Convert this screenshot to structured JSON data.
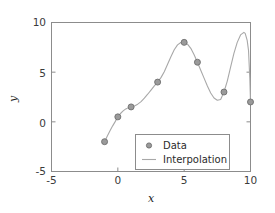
{
  "chart_data": {
    "type": "line",
    "title": "",
    "xlabel": "x",
    "ylabel": "y",
    "xlim": [
      -5,
      10
    ],
    "ylim": [
      -5,
      10
    ],
    "xticks": [
      -5,
      0,
      5,
      10
    ],
    "xticklabels": [
      "-5",
      "0",
      "5",
      "10"
    ],
    "yticks": [
      -5,
      0,
      5,
      10
    ],
    "yticklabels": [
      "-5",
      "0",
      "5",
      "10"
    ],
    "grid": false,
    "legend_position": "lower right",
    "series": [
      {
        "name": "Data",
        "type": "scatter",
        "marker": "circle",
        "color": "#9a9a9a",
        "x": [
          -1,
          0,
          1,
          3,
          5,
          6,
          8,
          10
        ],
        "y": [
          -2,
          0.5,
          1.5,
          4,
          8,
          6,
          3,
          2
        ]
      },
      {
        "name": "Interpolation",
        "type": "line",
        "color": "#a8a8a8",
        "x": [
          -1,
          -0.8,
          -0.6,
          -0.4,
          -0.2,
          0,
          0.2,
          0.4,
          0.6,
          0.8,
          1,
          1.25,
          1.5,
          1.75,
          2,
          2.25,
          2.5,
          2.75,
          3,
          3.25,
          3.5,
          3.75,
          4,
          4.25,
          4.5,
          4.75,
          5,
          5.25,
          5.5,
          5.75,
          6,
          6.25,
          6.5,
          6.75,
          7,
          7.25,
          7.5,
          7.75,
          8,
          8.25,
          8.5,
          8.75,
          9,
          9.25,
          9.5,
          9.6,
          9.75,
          9.85,
          9.95,
          10
        ],
        "y": [
          -2,
          -1.45,
          -0.92,
          -0.43,
          0.02,
          0.5,
          0.84,
          1.1,
          1.3,
          1.43,
          1.5,
          1.6,
          1.78,
          2.04,
          2.38,
          2.78,
          3.2,
          3.62,
          4,
          4.45,
          5.05,
          5.8,
          6.55,
          7.25,
          7.75,
          7.99,
          8,
          7.82,
          7.4,
          6.75,
          6,
          5.2,
          4.4,
          3.6,
          2.9,
          2.4,
          2.18,
          2.25,
          3,
          4.1,
          5.5,
          6.9,
          8,
          8.75,
          9,
          8.9,
          8.2,
          7.2,
          4.3,
          2
        ]
      }
    ]
  },
  "legend": {
    "entries": [
      {
        "label": "Data",
        "symbol": "marker-circle"
      },
      {
        "label": "Interpolation",
        "symbol": "line-segment"
      }
    ]
  },
  "colors": {
    "axis": "#8c8c8c",
    "curve": "#a8a8a8",
    "marker_fill": "#9a9a9a",
    "marker_edge": "#6e6e6e",
    "text": "#2b2b2b",
    "background": "#ffffff"
  }
}
